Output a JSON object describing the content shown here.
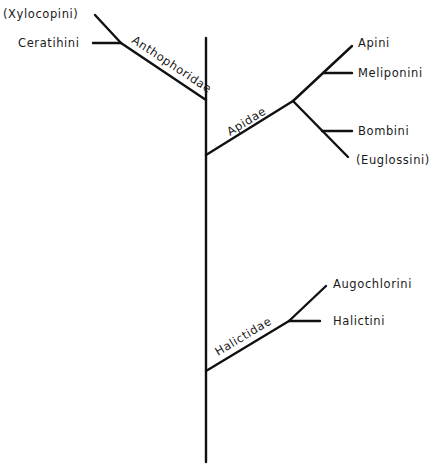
{
  "diagram": {
    "type": "phylogenetic-tree",
    "families": [
      {
        "name": "Anthophoridae",
        "tribes": [
          "(Xylocopini)",
          "Ceratihini"
        ]
      },
      {
        "name": "Apidae",
        "tribes": [
          "Apini",
          "Meliponini",
          "Bombini",
          "(Euglossini)"
        ]
      },
      {
        "name": "Halictidae",
        "tribes": [
          "Augochlorini",
          "Halictini"
        ]
      }
    ]
  },
  "labels": {
    "xylocopini": "(Xylocopini)",
    "ceratinini": "Ceratihini",
    "anthophoridae": "Anthophoridae",
    "apini": "Apini",
    "meliponini": "Meliponini",
    "apidae": "Apidae",
    "bombini": "Bombini",
    "euglossini": "(Euglossini)",
    "augochlorini": "Augochlorini",
    "halictini": "Halictini",
    "halictidae": "Halictidae"
  }
}
